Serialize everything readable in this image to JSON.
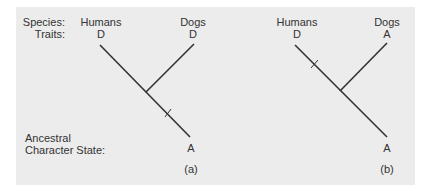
{
  "legend": {
    "species_label": "Species:",
    "traits_label": "Traits:",
    "ancestral_label_line1": "Ancestral",
    "ancestral_label_line2": "Character State:"
  },
  "trees": [
    {
      "caption": "(a)",
      "species": [
        {
          "name": "Humans",
          "trait": "D"
        },
        {
          "name": "Dogs",
          "trait": "D"
        }
      ],
      "ancestral_state": "A",
      "change_marker_branch": "root-stem"
    },
    {
      "caption": "(b)",
      "species": [
        {
          "name": "Humans",
          "trait": "D"
        },
        {
          "name": "Dogs",
          "trait": "A"
        }
      ],
      "ancestral_state": "A",
      "change_marker_branch": "humans"
    }
  ],
  "colors": {
    "background": "#ececec",
    "line": "#333333"
  }
}
